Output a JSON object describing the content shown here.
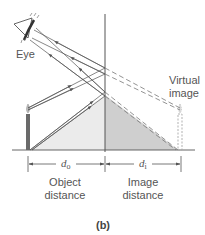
{
  "figure": {
    "caption": "(b)",
    "labels": {
      "eye": "Eye",
      "virtual_image_line1": "Virtual",
      "virtual_image_line2": "image",
      "object_distance_symbol": "d",
      "object_distance_subscript": "o",
      "image_distance_symbol": "d",
      "image_distance_subscript": "i",
      "object_distance_line1": "Object",
      "object_distance_line2": "distance",
      "image_distance_line1": "Image",
      "image_distance_line2": "distance"
    },
    "colors": {
      "mirror": "#555555",
      "rays": "#555555",
      "object_triangle": "#ebebeb",
      "image_triangle": "#cfcfcf",
      "candle": "#6a6a6a",
      "virtual_candle": "#a8a8a8",
      "text": "#555555"
    }
  }
}
